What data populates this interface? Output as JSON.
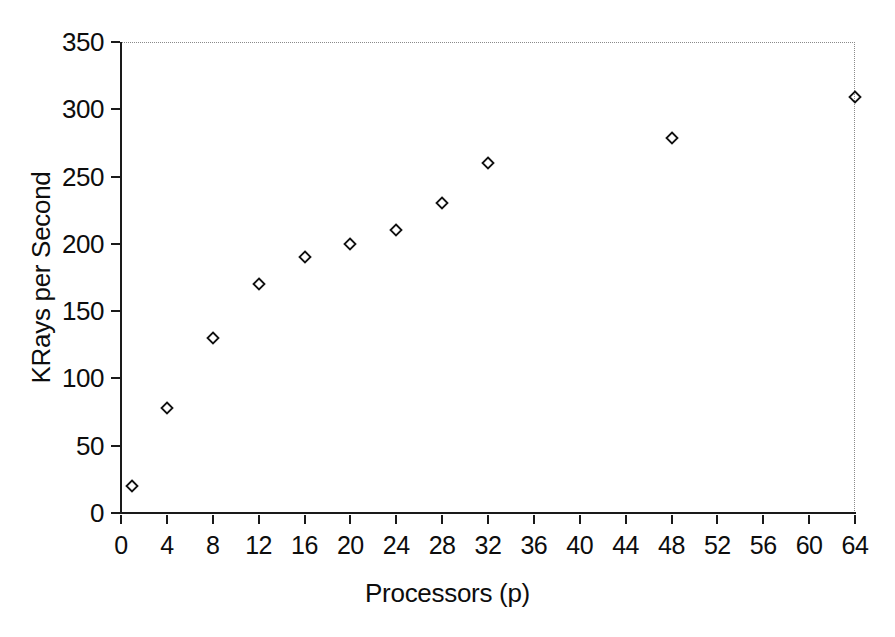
{
  "chart_data": {
    "type": "scatter",
    "title": "",
    "xlabel": "Processors (p)",
    "ylabel": "KRays per Second",
    "xlim": [
      0,
      64
    ],
    "ylim": [
      0,
      350
    ],
    "xticks": [
      0,
      4,
      8,
      12,
      16,
      20,
      24,
      28,
      32,
      36,
      40,
      44,
      48,
      52,
      56,
      60,
      64
    ],
    "yticks": [
      0,
      50,
      100,
      150,
      200,
      250,
      300,
      350
    ],
    "xtick_labels": [
      "0",
      "4",
      "8",
      "12",
      "16",
      "20",
      "24",
      "28",
      "32",
      "36",
      "40",
      "44",
      "48",
      "52",
      "56",
      "60",
      "64"
    ],
    "ytick_labels": [
      "0",
      "50",
      "100",
      "150",
      "200",
      "250",
      "300",
      "350"
    ],
    "grid": false,
    "legend": null,
    "marker": "open-diamond",
    "marker_color": "#111111",
    "series": [
      {
        "name": "KRays per Second",
        "x": [
          1,
          4,
          8,
          12,
          16,
          20,
          24,
          28,
          32,
          48,
          64
        ],
        "y": [
          20,
          78,
          130,
          170,
          190,
          200,
          210,
          230,
          260,
          279,
          309
        ]
      }
    ],
    "points": [
      {
        "x": 1,
        "y": 20
      },
      {
        "x": 4,
        "y": 78
      },
      {
        "x": 8,
        "y": 130
      },
      {
        "x": 12,
        "y": 170
      },
      {
        "x": 16,
        "y": 190
      },
      {
        "x": 20,
        "y": 200
      },
      {
        "x": 24,
        "y": 210
      },
      {
        "x": 28,
        "y": 230
      },
      {
        "x": 32,
        "y": 260
      },
      {
        "x": 48,
        "y": 279
      },
      {
        "x": 64,
        "y": 309
      }
    ]
  },
  "colors": {
    "background": "#ffffff",
    "axis": "#1a1a1a",
    "text": "#0d0d0d",
    "border_dotted": "#8a8a8a",
    "marker": "#111111"
  }
}
